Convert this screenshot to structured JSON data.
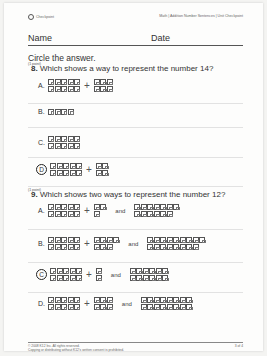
{
  "header": {
    "left_label": "Checkpoint",
    "right_label": "Math | Addition Number Sentences | Unit Checkpoint"
  },
  "name_row": {
    "name_label": "Name",
    "date_label": "Date"
  },
  "instruction": "Circle the answer.",
  "questions": [
    {
      "points": "(1 point)",
      "number": "8.",
      "text": "Which shows a way to represent the number 14?",
      "selected": "D",
      "options": [
        {
          "letter": "A.",
          "groups": [
            [
              5,
              5
            ],
            [
              3,
              3
            ]
          ],
          "joiners": [
            "+"
          ]
        },
        {
          "letter": "B.",
          "groups": [
            [
              4
            ]
          ],
          "joiners": []
        },
        {
          "letter": "C.",
          "groups": [
            [
              5,
              5
            ]
          ],
          "joiners": []
        },
        {
          "letter": "D",
          "groups": [
            [
              5,
              5
            ],
            [
              2,
              2
            ]
          ],
          "joiners": [
            "+"
          ]
        }
      ]
    },
    {
      "points": "(1 point)",
      "number": "9.",
      "text": "Which shows two ways to represent the number 12?",
      "selected": "C",
      "options": [
        {
          "letter": "A.",
          "groups": [
            [
              5,
              5
            ],
            [
              2,
              1
            ],
            [
              7,
              6
            ]
          ],
          "joiners": [
            "+",
            "and"
          ]
        },
        {
          "letter": "B.",
          "groups": [
            [
              5,
              5
            ],
            [
              4,
              3
            ],
            [
              9,
              8
            ]
          ],
          "joiners": [
            "+",
            "and"
          ]
        },
        {
          "letter": "C",
          "groups": [
            [
              5,
              5
            ],
            [
              1,
              1
            ],
            [
              6,
              6
            ]
          ],
          "joiners": [
            "+",
            "and"
          ]
        },
        {
          "letter": "D.",
          "groups": [
            [
              5,
              5
            ],
            [
              3,
              3
            ],
            [
              8,
              8
            ]
          ],
          "joiners": [
            "+",
            "and"
          ]
        }
      ]
    }
  ],
  "footer": {
    "copyright": "© 2008 K12 Inc. All rights reserved.",
    "notice": "Copying or distributing without K12's written consent is prohibited.",
    "page": "3 of 4"
  }
}
